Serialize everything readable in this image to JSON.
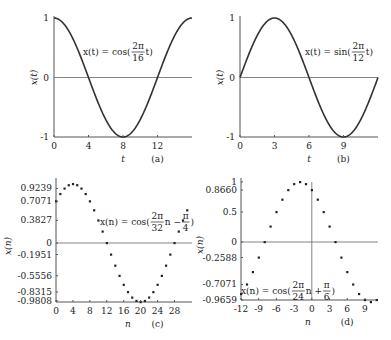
{
  "chart_data": [
    {
      "id": "a",
      "type": "line",
      "caption": "(a)",
      "equation": "x(t) = cos(2π/16 t)",
      "eq_parts": {
        "lhs": "x(t) = cos(",
        "num": "2π",
        "den": "16",
        "rhs": "t)"
      },
      "xlabel": "t",
      "ylabel": "x(t)",
      "xlim": [
        0,
        16
      ],
      "ylim": [
        -1,
        1
      ],
      "xticks": [
        0,
        4,
        8,
        12
      ],
      "yticks": [
        {
          "v": 1,
          "label": "1"
        },
        {
          "v": 0,
          "label": "0"
        },
        {
          "v": -1,
          "label": "-1"
        }
      ],
      "func": "cos",
      "omega_num": 2,
      "omega_den": 16,
      "phase": 0,
      "box": {
        "x0": 54,
        "x1": 192,
        "ytop": 18,
        "ybot": 137
      }
    },
    {
      "id": "b",
      "type": "line",
      "caption": "(b)",
      "equation": "x(t) = sin(2π/12 t)",
      "eq_parts": {
        "lhs": "x(t) = sin(",
        "num": "2π",
        "den": "12",
        "rhs": "t)"
      },
      "xlabel": "t",
      "ylabel": "x(t)",
      "xlim": [
        0,
        12
      ],
      "ylim": [
        -1,
        1
      ],
      "xticks": [
        0,
        3,
        6,
        9
      ],
      "yticks": [
        {
          "v": 1,
          "label": "1"
        },
        {
          "v": 0,
          "label": "0"
        },
        {
          "v": -1,
          "label": "-1"
        }
      ],
      "func": "sin",
      "omega_num": 2,
      "omega_den": 12,
      "phase": 0,
      "box": {
        "x0": 240,
        "x1": 378,
        "ytop": 18,
        "ybot": 137
      }
    },
    {
      "id": "c",
      "type": "scatter",
      "caption": "(c)",
      "equation": "x(n) = cos(2π/32 n − π/4)",
      "eq_parts": {
        "lhs": "x(n) = cos(",
        "num": "2π",
        "den": "32",
        "mid": "n −",
        "num2": "π",
        "den2": "4",
        "rhs": ")"
      },
      "xlabel": "n",
      "ylabel": "x(n)",
      "xlim": [
        0,
        31
      ],
      "ylim": [
        -1,
        1
      ],
      "xticks": [
        0,
        4,
        8,
        12,
        16,
        20,
        24,
        28
      ],
      "yticks": [
        {
          "v": 0.9239,
          "label": "0.9239"
        },
        {
          "v": 0.7071,
          "label": "0.7071"
        },
        {
          "v": 0.3827,
          "label": "0.3827"
        },
        {
          "v": 0,
          "label": "0"
        },
        {
          "v": -0.1951,
          "label": "-0.1951"
        },
        {
          "v": -0.5556,
          "label": "-0.5556"
        },
        {
          "v": -0.8315,
          "label": "-0.8315"
        },
        {
          "v": -0.9808,
          "label": "-0.9808"
        }
      ],
      "n": [
        0,
        1,
        2,
        3,
        4,
        5,
        6,
        7,
        8,
        9,
        10,
        11,
        12,
        13,
        14,
        15,
        16,
        17,
        18,
        19,
        20,
        21,
        22,
        23,
        24,
        25,
        26,
        27,
        28,
        29,
        30,
        31
      ],
      "values": [
        0.7071,
        0.8315,
        0.9239,
        0.9808,
        1.0,
        0.9808,
        0.9239,
        0.8315,
        0.7071,
        0.5556,
        0.3827,
        0.1951,
        0.0,
        -0.1951,
        -0.3827,
        -0.5556,
        -0.7071,
        -0.8315,
        -0.9239,
        -0.9808,
        -1.0,
        -0.9808,
        -0.9239,
        -0.8315,
        -0.7071,
        -0.5556,
        -0.3827,
        -0.1951,
        0.0,
        0.1951,
        0.3827,
        0.5556
      ],
      "box": {
        "x0": 56,
        "x1": 192,
        "ytop": 182,
        "ybot": 302,
        "yzero": 243,
        "scale": 59,
        "xstep": 4.23
      }
    },
    {
      "id": "d",
      "type": "scatter",
      "caption": "(d)",
      "equation": "x(n) = cos(2π/24 n + π/6)",
      "eq_parts": {
        "lhs": "x(n) = cos(",
        "num": "2π",
        "den": "24",
        "mid": "n +",
        "num2": "π",
        "den2": "6",
        "rhs": ")"
      },
      "xlabel": "n",
      "ylabel": "x(n)",
      "xlim": [
        -12,
        11
      ],
      "ylim": [
        -1,
        1
      ],
      "xticks": [
        -12,
        -9,
        -6,
        -3,
        0,
        3,
        6,
        9
      ],
      "yticks": [
        {
          "v": 1,
          "label": "1"
        },
        {
          "v": 0.866,
          "label": "0.8660"
        },
        {
          "v": 0.5,
          "label": "0.5"
        },
        {
          "v": 0,
          "label": "0"
        },
        {
          "v": -0.2588,
          "label": "-0.2588"
        },
        {
          "v": -0.7071,
          "label": "-0.7071"
        },
        {
          "v": -0.9659,
          "label": "-0.9659"
        }
      ],
      "n": [
        -12,
        -11,
        -10,
        -9,
        -8,
        -7,
        -6,
        -5,
        -4,
        -3,
        -2,
        -1,
        0,
        1,
        2,
        3,
        4,
        5,
        6,
        7,
        8,
        9,
        10,
        11
      ],
      "values": [
        -0.866,
        -0.7071,
        -0.5,
        -0.2588,
        0.0,
        0.2588,
        0.5,
        0.7071,
        0.866,
        0.9659,
        1.0,
        0.9659,
        0.866,
        0.7071,
        0.5,
        0.2588,
        0.0,
        -0.2588,
        -0.5,
        -0.7071,
        -0.866,
        -0.9659,
        -1.0,
        -0.9659
      ],
      "box": {
        "x0": 241,
        "x1": 378,
        "ytop": 182,
        "ybot": 300,
        "yzero": 242,
        "scale": 60,
        "xstep": 5.9
      }
    }
  ]
}
